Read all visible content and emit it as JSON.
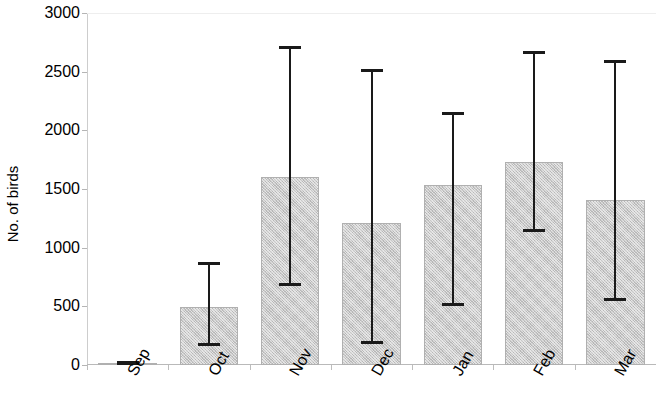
{
  "chart_data": {
    "type": "bar",
    "title": "",
    "xlabel": "",
    "ylabel": "No. of birds",
    "categories": [
      "Sep",
      "Oct",
      "Nov",
      "Dec",
      "Jan",
      "Feb",
      "Mar"
    ],
    "values": [
      15,
      495,
      1600,
      1210,
      1530,
      1730,
      1410
    ],
    "error_upper": [
      30,
      880,
      2720,
      2520,
      2160,
      2680,
      2600
    ],
    "error_lower": [
      0,
      165,
      670,
      180,
      505,
      1135,
      545
    ],
    "ylim": [
      0,
      3000
    ],
    "ytick_values": [
      0,
      500,
      1000,
      1500,
      2000,
      2500,
      3000
    ],
    "ytick_labels": [
      "0",
      "500",
      "1000",
      "1500",
      "2000",
      "2500",
      "3000"
    ],
    "grid": false,
    "legend": null,
    "series": [
      {
        "name": "No. of birds",
        "values": [
          15,
          495,
          1600,
          1210,
          1530,
          1730,
          1410
        ]
      }
    ],
    "bar_color": "#c9c9c9",
    "error_color": "#1a1a1a",
    "axis_color": "#b9b9b9"
  }
}
